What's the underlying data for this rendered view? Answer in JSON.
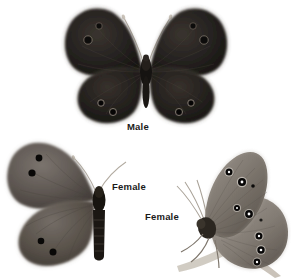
{
  "plate": {
    "title": "Butterfly specimen plate",
    "background_color": "#ffffff",
    "width": 291,
    "height": 278,
    "medium": "grayscale photographic plate",
    "specimen_count": 3
  },
  "labels": {
    "male": "Male",
    "female_dorsal": "Female",
    "female_lateral": "Female"
  },
  "colors": {
    "male_wing_dark": "#1c1a18",
    "male_wing_mid": "#2b2724",
    "male_wing_edge": "#4a433d",
    "female_wing_dark": "#4a4440",
    "female_wing_mid": "#635c57",
    "female_wing_light": "#7d7671",
    "lateral_wing_light": "#8d8780",
    "lateral_wing_mid": "#6f6861",
    "eyespot_black": "#0b0a09",
    "eyespot_pupil": "#ffffff",
    "eyespot_ring": "#cfc8c0",
    "body_dark": "#151311",
    "antenna": "#b9b2a9",
    "stem": "#c9c3ba",
    "label_text": "#1a1a1a",
    "background": "#ffffff"
  },
  "specimens": [
    {
      "id": "male-dorsal",
      "name": "Male",
      "view": "dorsal",
      "wings": "spread",
      "ground_color": "very dark brown-black",
      "eyespots_forewing_per_side": 2,
      "eyespots_hindwing_per_side": 2,
      "antennae": "pale, V-shaped",
      "position": {
        "x": 60,
        "y": 4,
        "width": 172,
        "height": 128
      }
    },
    {
      "id": "female-dorsal-half",
      "name": "Female",
      "view": "dorsal",
      "wings": "left side only",
      "ground_color": "medium gray-brown",
      "eyespots_forewing": 2,
      "eyespots_hindwing": 2,
      "abdomen": "banded",
      "position": {
        "x": 6,
        "y": 140,
        "width": 116,
        "height": 130
      }
    },
    {
      "id": "female-lateral",
      "name": "Female",
      "view": "lateral underside",
      "wings": "closed",
      "ground_color": "pale gray",
      "ocelli_forewing": 2,
      "ocelli_hindwing": 5,
      "perch": "pale grass stem",
      "position": {
        "x": 178,
        "y": 150,
        "width": 112,
        "height": 126
      }
    }
  ]
}
